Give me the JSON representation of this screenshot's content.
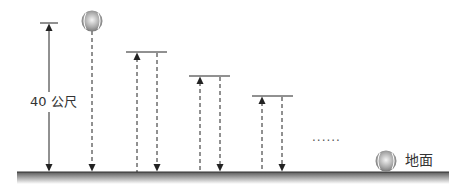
{
  "diagram": {
    "height_label": "40 公尺",
    "ground_label": "地面",
    "ellipsis": "......",
    "colors": {
      "line": "#222222",
      "ground_top": "#5a5a5a",
      "ground_bottom": "#ffffff",
      "ball": "#9a9a9a"
    },
    "bounces": [
      {
        "up_x": 137,
        "down_x": 157,
        "top_y": 52
      },
      {
        "up_x": 200,
        "down_x": 220,
        "top_y": 76
      },
      {
        "up_x": 262,
        "down_x": 282,
        "top_y": 96
      }
    ]
  }
}
